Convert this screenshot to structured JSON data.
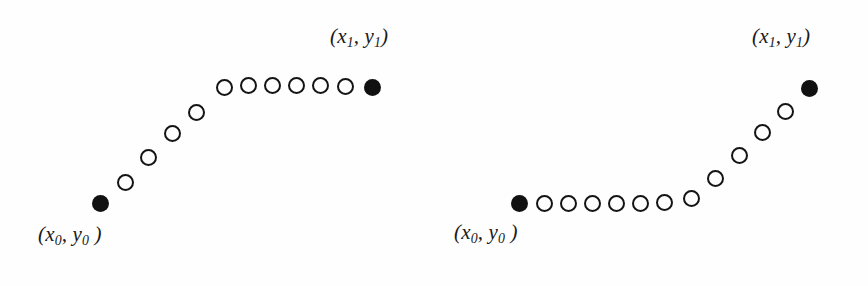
{
  "figure": {
    "caption": "",
    "background_color": "#fefefe",
    "ink_color": "#111111",
    "panels": [
      {
        "id": "left",
        "name": "concave-path-up-then-flat",
        "description": "Discrete path rising diagonally from start then running horizontally to end",
        "start_label": {
          "open_paren": "(",
          "x_var": "x",
          "x_sub": "0",
          "comma": ", ",
          "y_var": "y",
          "y_sub": "0",
          "close_paren": " )",
          "text": "(x0, y0 )"
        },
        "end_label": {
          "open_paren": "(",
          "x_var": "x",
          "x_sub": "1",
          "comma": ", ",
          "y_var": "y",
          "y_sub": "1",
          "close_paren": ")",
          "text": "(x1, y1)"
        },
        "node_count": 13,
        "open_node_count": 11,
        "filled_node_count": 2,
        "node_diameter_px": 17,
        "nodes": [
          {
            "index": 0,
            "cx": 100,
            "cy": 203,
            "type": "filled"
          },
          {
            "index": 1,
            "cx": 125,
            "cy": 182,
            "type": "open"
          },
          {
            "index": 2,
            "cx": 148,
            "cy": 157,
            "type": "open"
          },
          {
            "index": 3,
            "cx": 172,
            "cy": 133,
            "type": "open"
          },
          {
            "index": 4,
            "cx": 196,
            "cy": 112,
            "type": "open"
          },
          {
            "index": 5,
            "cx": 224,
            "cy": 87,
            "type": "open"
          },
          {
            "index": 6,
            "cx": 248,
            "cy": 85,
            "type": "open"
          },
          {
            "index": 7,
            "cx": 272,
            "cy": 85,
            "type": "open"
          },
          {
            "index": 8,
            "cx": 296,
            "cy": 85,
            "type": "open"
          },
          {
            "index": 9,
            "cx": 320,
            "cy": 85,
            "type": "open"
          },
          {
            "index": 10,
            "cx": 345,
            "cy": 86,
            "type": "open"
          },
          {
            "index": 11,
            "cx": 372,
            "cy": 87,
            "type": "filled"
          }
        ],
        "start_label_pos": {
          "x": 38,
          "y": 222
        },
        "end_label_pos": {
          "x": 330,
          "y": 24
        }
      },
      {
        "id": "right",
        "name": "convex-path-flat-then-up",
        "description": "Discrete path running horizontally from start then rising diagonally to end",
        "start_label": {
          "open_paren": "(",
          "x_var": "x",
          "x_sub": "0",
          "comma": ", ",
          "y_var": "y",
          "y_sub": "0",
          "close_paren": " )",
          "text": "(x0, y0 )"
        },
        "end_label": {
          "open_paren": "(",
          "x_var": "x",
          "x_sub": "1",
          "comma": ", ",
          "y_var": "y",
          "y_sub": "1",
          "close_paren": ")",
          "text": "(x1, y1)"
        },
        "node_count": 13,
        "open_node_count": 11,
        "filled_node_count": 2,
        "node_diameter_px": 17,
        "nodes": [
          {
            "index": 0,
            "cx": 85,
            "cy": 203,
            "type": "filled"
          },
          {
            "index": 1,
            "cx": 110,
            "cy": 203,
            "type": "open"
          },
          {
            "index": 2,
            "cx": 134,
            "cy": 203,
            "type": "open"
          },
          {
            "index": 3,
            "cx": 158,
            "cy": 203,
            "type": "open"
          },
          {
            "index": 4,
            "cx": 182,
            "cy": 203,
            "type": "open"
          },
          {
            "index": 5,
            "cx": 206,
            "cy": 203,
            "type": "open"
          },
          {
            "index": 6,
            "cx": 230,
            "cy": 202,
            "type": "open"
          },
          {
            "index": 7,
            "cx": 257,
            "cy": 198,
            "type": "open"
          },
          {
            "index": 8,
            "cx": 281,
            "cy": 178,
            "type": "open"
          },
          {
            "index": 9,
            "cx": 305,
            "cy": 155,
            "type": "open"
          },
          {
            "index": 10,
            "cx": 328,
            "cy": 132,
            "type": "open"
          },
          {
            "index": 11,
            "cx": 351,
            "cy": 111,
            "type": "open"
          },
          {
            "index": 12,
            "cx": 375,
            "cy": 88,
            "type": "filled"
          }
        ],
        "start_label_pos": {
          "x": 20,
          "y": 220
        },
        "end_label_pos": {
          "x": 318,
          "y": 24
        }
      }
    ]
  }
}
